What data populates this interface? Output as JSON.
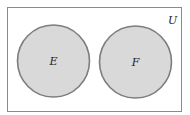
{
  "diagram": {
    "type": "venn",
    "universe": {
      "label": "U",
      "x": 7,
      "y": 7,
      "width": 175,
      "height": 105
    },
    "sets": [
      {
        "label": "E",
        "cx": 53.5,
        "cy": 61,
        "r": 36
      },
      {
        "label": "F",
        "cx": 135.5,
        "cy": 62,
        "r": 36
      }
    ],
    "colors": {
      "background": "#ffffff",
      "universe_stroke": "#8a8a8a",
      "set_fill": "#d9d9d9",
      "set_stroke": "#7d7d7d",
      "label": "#222222"
    }
  }
}
